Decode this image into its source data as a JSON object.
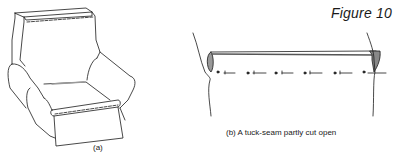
{
  "figure": {
    "title": "Figure 10",
    "panels": [
      {
        "id": "a",
        "caption": "(a)",
        "depicts": "armchair with loose cover showing tuck-seam lines"
      },
      {
        "id": "b",
        "caption": "(b)  A tuck-seam partly cut open",
        "depicts": "fabric tuck-seam with stitches partly cut"
      }
    ]
  },
  "colors": {
    "ink": "#1a1a1a",
    "background": "#ffffff",
    "shade": "#888888"
  }
}
